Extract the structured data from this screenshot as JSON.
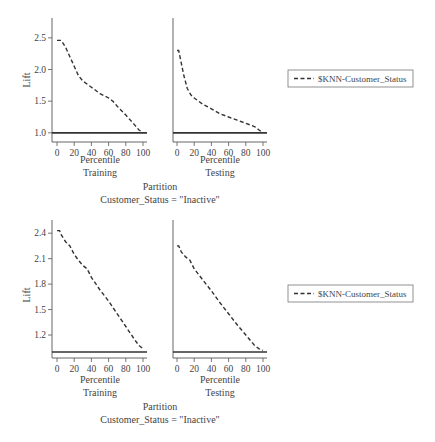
{
  "chart_data": [
    {
      "type": "line",
      "title": "Customer_Status = \"Inactive\"",
      "xlabel_shared": "Partition",
      "ylabel": "Lift",
      "panels": [
        {
          "name": "Training",
          "xlabel": "Percentile",
          "x_ticks": [
            0,
            20,
            40,
            60,
            80,
            100
          ],
          "ylim": [
            0.95,
            2.75
          ],
          "y_ticks": [
            1.0,
            1.5,
            2.0,
            2.5
          ],
          "y_tick_labels": [
            "1.0",
            "1.5",
            "2.0",
            "2.5"
          ],
          "baseline": 1.0,
          "series": [
            {
              "name": "$KNN-Customer_Status",
              "x": [
                0,
                5,
                10,
                15,
                20,
                25,
                30,
                40,
                50,
                60,
                65,
                70,
                80,
                90,
                95,
                100
              ],
              "y": [
                2.46,
                2.46,
                2.35,
                2.2,
                2.05,
                1.9,
                1.82,
                1.72,
                1.62,
                1.55,
                1.5,
                1.42,
                1.28,
                1.13,
                1.05,
                1.0
              ]
            }
          ]
        },
        {
          "name": "Testing",
          "xlabel": "Percentile",
          "x_ticks": [
            0,
            20,
            40,
            60,
            80,
            100
          ],
          "ylim": [
            0.95,
            2.75
          ],
          "y_ticks": [],
          "y_tick_labels": [],
          "baseline": 1.0,
          "series": [
            {
              "name": "$KNN-Customer_Status",
              "x": [
                0,
                2,
                5,
                8,
                12,
                16,
                20,
                30,
                40,
                50,
                60,
                70,
                80,
                90,
                95,
                100
              ],
              "y": [
                2.3,
                2.3,
                2.1,
                1.9,
                1.7,
                1.6,
                1.55,
                1.45,
                1.38,
                1.3,
                1.25,
                1.2,
                1.15,
                1.1,
                1.05,
                1.0
              ]
            }
          ]
        }
      ],
      "legend": {
        "entries": [
          "$KNN-Customer_Status"
        ],
        "position": "right"
      }
    },
    {
      "type": "line",
      "title": "Customer_Status = \"Inactive\"",
      "xlabel_shared": "Partition",
      "ylabel": "Lift",
      "panels": [
        {
          "name": "Training",
          "xlabel": "Percentile",
          "x_ticks": [
            0,
            20,
            40,
            60,
            80,
            100
          ],
          "ylim": [
            1.0,
            2.52
          ],
          "y_ticks": [
            1.2,
            1.5,
            1.8,
            2.1,
            2.4
          ],
          "y_tick_labels": [
            "1.2",
            "1.5",
            "1.8",
            "2.1",
            "2.4"
          ],
          "baseline": 1.0,
          "series": [
            {
              "name": "$KNN-Customer_Status",
              "x": [
                0,
                3,
                5,
                10,
                15,
                20,
                25,
                30,
                35,
                40,
                50,
                60,
                70,
                80,
                90,
                95,
                100
              ],
              "y": [
                2.43,
                2.43,
                2.38,
                2.3,
                2.25,
                2.15,
                2.08,
                2.02,
                1.98,
                1.88,
                1.73,
                1.6,
                1.45,
                1.3,
                1.15,
                1.08,
                1.04
              ]
            }
          ]
        },
        {
          "name": "Testing",
          "xlabel": "Percentile",
          "x_ticks": [
            0,
            20,
            40,
            60,
            80,
            100
          ],
          "ylim": [
            1.0,
            2.52
          ],
          "y_ticks": [],
          "y_tick_labels": [],
          "baseline": 1.0,
          "series": [
            {
              "name": "$KNN-Customer_Status",
              "x": [
                0,
                2,
                5,
                10,
                15,
                20,
                30,
                40,
                50,
                60,
                70,
                80,
                90,
                95,
                100
              ],
              "y": [
                2.25,
                2.25,
                2.18,
                2.12,
                2.08,
                1.98,
                1.85,
                1.72,
                1.58,
                1.45,
                1.32,
                1.2,
                1.08,
                1.04,
                1.02
              ]
            }
          ]
        }
      ],
      "legend": {
        "entries": [
          "$KNN-Customer_Status"
        ],
        "position": "right"
      }
    }
  ],
  "figures": [
    {
      "ylabel": "Lift",
      "partition_label": "Partition",
      "condition_label": "Customer_Status = \"Inactive\"",
      "legend_label": "$KNN-Customer_Status",
      "panels": [
        {
          "xlabel": "Percentile",
          "name": "Training"
        },
        {
          "xlabel": "Percentile",
          "name": "Testing"
        }
      ]
    },
    {
      "ylabel": "Lift",
      "partition_label": "Partition",
      "condition_label": "Customer_Status = \"Inactive\"",
      "legend_label": "$KNN-Customer_Status",
      "panels": [
        {
          "xlabel": "Percentile",
          "name": "Training"
        },
        {
          "xlabel": "Percentile",
          "name": "Testing"
        }
      ]
    }
  ],
  "colors": {
    "axis": "#555555",
    "series": "#333333",
    "baseline": "#333333",
    "text": "#444444"
  }
}
